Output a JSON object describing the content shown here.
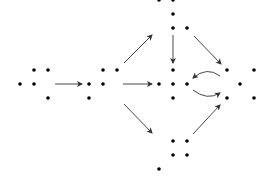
{
  "diagram": {
    "type": "young-diagram-poset-of-dot-configurations",
    "colors": {
      "dot": "#000000",
      "arrow": "#333333",
      "background": "#ffffff"
    },
    "nodes": [
      {
        "id": "n1",
        "label": "left-cluster",
        "dots": [
          [
            34,
            70
          ],
          [
            48,
            70
          ],
          [
            20,
            84
          ],
          [
            34,
            84
          ],
          [
            48,
            98
          ]
        ]
      },
      {
        "id": "n2",
        "label": "second-cluster",
        "dots": [
          [
            103,
            70
          ],
          [
            117,
            70
          ],
          [
            89,
            84
          ],
          [
            103,
            84
          ],
          [
            89,
            98
          ]
        ]
      },
      {
        "id": "n3",
        "label": "top-cluster",
        "dots": [
          [
            159,
            0
          ],
          [
            173,
            0
          ],
          [
            173,
            14
          ],
          [
            173,
            28
          ],
          [
            187,
            28
          ]
        ]
      },
      {
        "id": "n4",
        "label": "center-cluster",
        "dots": [
          [
            173,
            70
          ],
          [
            159,
            84
          ],
          [
            173,
            84
          ],
          [
            187,
            84
          ],
          [
            173,
            98
          ]
        ]
      },
      {
        "id": "n5",
        "label": "bottom-cluster",
        "dots": [
          [
            173,
            141
          ],
          [
            187,
            141
          ],
          [
            173,
            155
          ],
          [
            187,
            155
          ],
          [
            159,
            169
          ]
        ]
      },
      {
        "id": "n6",
        "label": "right-cluster",
        "dots": [
          [
            227,
            70
          ],
          [
            254,
            70
          ],
          [
            240,
            84
          ],
          [
            227,
            98
          ],
          [
            254,
            98
          ]
        ]
      }
    ],
    "edges": [
      {
        "from": "n1",
        "to": "n2",
        "path": "M55 84 L82 84",
        "curved": false
      },
      {
        "from": "n2",
        "to": "n4",
        "path": "M123 84 L152 84",
        "curved": false
      },
      {
        "from": "n2",
        "to": "n3",
        "path": "M124 63 L152 35",
        "curved": false
      },
      {
        "from": "n2",
        "to": "n5",
        "path": "M124 104 L152 133",
        "curved": false
      },
      {
        "from": "n3",
        "to": "n4",
        "path": "M173 35 L173 63",
        "curved": false
      },
      {
        "from": "n3",
        "to": "n6",
        "path": "M194 36 L221 64",
        "curved": false
      },
      {
        "from": "n5",
        "to": "n6",
        "path": "M193 134 L220 105",
        "curved": false
      },
      {
        "from": "n6",
        "to": "n4",
        "path": "M220 76 Q207 66 193 78",
        "curved": true
      },
      {
        "from": "n4",
        "to": "n6",
        "path": "M193 90 Q207 101 220 93",
        "curved": true
      }
    ]
  }
}
